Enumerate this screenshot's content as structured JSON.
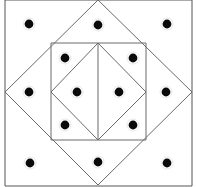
{
  "figure": {
    "canvas": {
      "width": 197,
      "height": 187,
      "background": "#ffffff"
    },
    "colors": {
      "dot": "#0a0a0a",
      "outer_border": "#555555",
      "diamond_stroke": "#6a6a6a",
      "inner_square_stroke": "#6a6a6a",
      "inner_diamond_stroke": "#6a6a6a",
      "center_line": "#6a6a6a"
    },
    "shapes": {
      "outer_border": {
        "name": "outer-rectangle-border",
        "left_x": 5,
        "right_x": 192,
        "top_y": 0,
        "bottom_y": 186
      },
      "outer_diamond": {
        "name": "outer-diamond",
        "points": "98,0 192,92 98,185 5,92"
      },
      "inner_square": {
        "name": "inner-square",
        "x": 51,
        "y": 43,
        "width": 95,
        "height": 97
      },
      "inner_diamond": {
        "name": "inner-diamond",
        "points": "98,43 146,92 98,140 51,92"
      },
      "center_vertical_line": {
        "name": "center-vertical-line",
        "x": 98,
        "y1": 43,
        "y2": 140
      }
    },
    "dots": {
      "count": 16,
      "radius": 4.4,
      "points": [
        {
          "id": "dot-r1-c1",
          "x": 29,
          "y": 24
        },
        {
          "id": "dot-r1-c2",
          "x": 98,
          "y": 25
        },
        {
          "id": "dot-r1-c3",
          "x": 167,
          "y": 24
        },
        {
          "id": "dot-r2-c1",
          "x": 65,
          "y": 58
        },
        {
          "id": "dot-r2-c2",
          "x": 133,
          "y": 58
        },
        {
          "id": "dot-r3-c1",
          "x": 29,
          "y": 92
        },
        {
          "id": "dot-r3-c2",
          "x": 77,
          "y": 92
        },
        {
          "id": "dot-r3-c3",
          "x": 119,
          "y": 92
        },
        {
          "id": "dot-r3-c4",
          "x": 166,
          "y": 92
        },
        {
          "id": "dot-r4-c1",
          "x": 65,
          "y": 125
        },
        {
          "id": "dot-r4-c2",
          "x": 133,
          "y": 125
        },
        {
          "id": "dot-r5-c1",
          "x": 30,
          "y": 163
        },
        {
          "id": "dot-r5-c2",
          "x": 98,
          "y": 162
        },
        {
          "id": "dot-r5-c3",
          "x": 167,
          "y": 163
        }
      ]
    }
  }
}
